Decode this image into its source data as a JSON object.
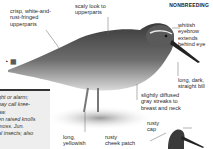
{
  "header": {
    "season_label": "NONBREEDING"
  },
  "icons": {
    "range_icon": "◔",
    "habitat_icon": "▦"
  },
  "labels": {
    "upperparts_fringed": "crisp, white-and-\nrust-fringed\nupperparts",
    "scaly_upperparts": "scaly look to\nupperparts",
    "eyebrow": "whitish\neyebrow\nextends\nbehind eye",
    "bill": "long, dark,\nstraight bill",
    "breast": "slightly diffused\ngray streaks to\nbreast and neck",
    "cap": "rusty\ncap",
    "cheek": "rusty\ncheek patch",
    "legs": "long,\nyellowish"
  },
  "info_box": {
    "text": "ght or alarm;\nbay call kree-\naw.\nen raised knolls\nmoss. Jun.\nal insects; also"
  },
  "colors": {
    "bird_dark": "#3a3a3a",
    "bird_mid": "#8a8a8a",
    "bird_light": "#d6d6d6",
    "box_bg": "#eeeeee"
  }
}
